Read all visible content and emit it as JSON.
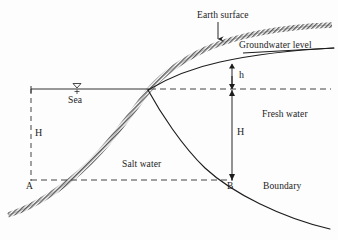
{
  "figure": {
    "type": "cross-section-diagram",
    "background_color": "#fdfdfd",
    "line_color": "#1c1c1c",
    "hatch_color": "#6b6b6b"
  },
  "labels": {
    "earth_surface": "Earth surface",
    "groundwater_level": "Groundwater level",
    "sea": "Sea",
    "fresh_water": "Fresh water",
    "salt_water": "Salt water",
    "boundary": "Boundary",
    "h_small": "h",
    "h_left": "H",
    "h_right": "H",
    "point_a": "A",
    "point_b": "B",
    "sea_surface_symbol": "water-table-triangle"
  },
  "icons": {
    "earth_surface_pointer": "down-arrow-icon",
    "sea_level_marker": "water-table-triangle-icon",
    "h_small_arrow": "double-head-vertical-arrow-icon",
    "h_right_arrow": "double-head-vertical-arrow-icon"
  },
  "geometry": {
    "sea_level_y": 89,
    "intersection_point": {
      "x": 148,
      "y": 90
    },
    "point_a": {
      "x": 31,
      "y": 180
    },
    "point_b": {
      "x": 232,
      "y": 180
    },
    "sea_line_start_x": 31,
    "sea_line_end_x": 148,
    "dashed_sea_level_end_x": 331,
    "dashed_base_start_x": 31,
    "dashed_base_end_x": 232,
    "groundwater_level_at_arrow_y": 68,
    "h_small_span": [
      68,
      89
    ],
    "h_right_span": [
      89,
      180
    ]
  },
  "annotations": {
    "h_small_meaning": "freshwater head above sea level",
    "h_right_meaning": "depth of freshwater-saltwater interface below sea level",
    "h_left_meaning": "depth of boundary at coastline"
  }
}
